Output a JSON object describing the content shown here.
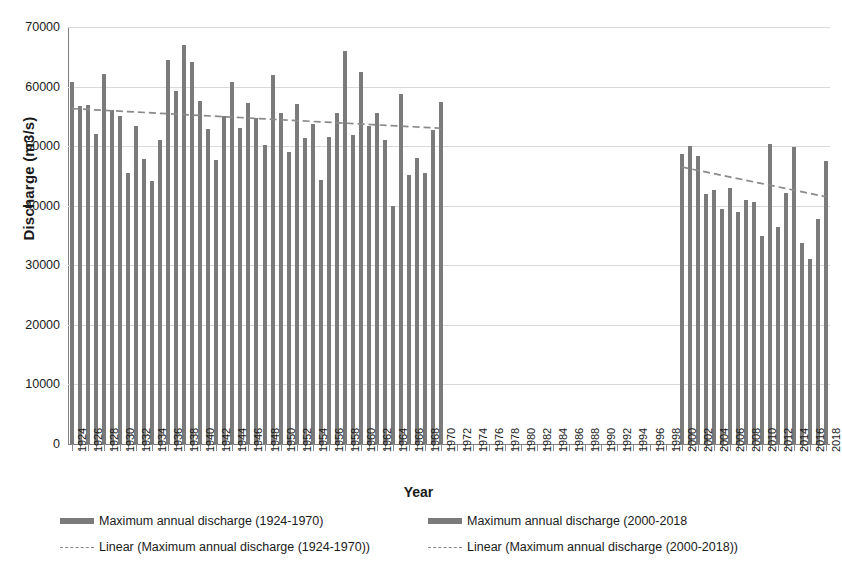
{
  "chart_data": {
    "type": "bar",
    "title": "",
    "xlabel": "Year",
    "ylabel": "Discharge (m3/s)",
    "ylim": [
      0,
      70000
    ],
    "ytick_values": [
      0,
      10000,
      20000,
      30000,
      40000,
      50000,
      60000,
      70000
    ],
    "ytick_labels": [
      "0",
      "10000",
      "20000",
      "30000",
      "40000",
      "50000",
      "60000",
      "70000"
    ],
    "grid": true,
    "legend_position": "bottom",
    "xtick_label_step": 2,
    "x_all": [
      1924,
      1925,
      1926,
      1927,
      1928,
      1929,
      1930,
      1931,
      1932,
      1933,
      1934,
      1935,
      1936,
      1937,
      1938,
      1939,
      1940,
      1941,
      1942,
      1943,
      1944,
      1945,
      1946,
      1947,
      1948,
      1949,
      1950,
      1951,
      1952,
      1953,
      1954,
      1955,
      1956,
      1957,
      1958,
      1959,
      1960,
      1961,
      1962,
      1963,
      1964,
      1965,
      1966,
      1967,
      1968,
      1969,
      1970,
      1971,
      1972,
      1973,
      1974,
      1975,
      1976,
      1977,
      1978,
      1979,
      1980,
      1981,
      1982,
      1983,
      1984,
      1985,
      1986,
      1987,
      1988,
      1989,
      1990,
      1991,
      1992,
      1993,
      1994,
      1995,
      1996,
      1997,
      1998,
      1999,
      2000,
      2001,
      2002,
      2003,
      2004,
      2005,
      2006,
      2007,
      2008,
      2009,
      2010,
      2011,
      2012,
      2013,
      2014,
      2015,
      2016,
      2017,
      2018
    ],
    "xtick_labels_shown": [
      "1924",
      "1926",
      "1928",
      "1930",
      "1932",
      "1934",
      "1936",
      "1938",
      "1940",
      "1942",
      "1944",
      "1946",
      "1948",
      "1950",
      "1952",
      "1954",
      "1956",
      "1958",
      "1960",
      "1962",
      "1964",
      "1966",
      "1968",
      "1970",
      "1972",
      "1974",
      "1976",
      "1978",
      "1980",
      "1982",
      "1984",
      "1986",
      "1988",
      "1990",
      "1992",
      "1994",
      "1996",
      "1998",
      "2000",
      "2002",
      "2004",
      "2006",
      "2008",
      "2010",
      "2012",
      "2014",
      "2016",
      "2018"
    ],
    "series": [
      {
        "name": "Maximum annual discharge (1924-1970)",
        "color": "#7b7b7b",
        "x": [
          1924,
          1925,
          1926,
          1927,
          1928,
          1929,
          1930,
          1931,
          1932,
          1933,
          1934,
          1935,
          1936,
          1937,
          1938,
          1939,
          1940,
          1941,
          1942,
          1943,
          1944,
          1945,
          1946,
          1947,
          1948,
          1949,
          1950,
          1951,
          1952,
          1953,
          1954,
          1955,
          1956,
          1957,
          1958,
          1959,
          1960,
          1961,
          1962,
          1963,
          1964,
          1965,
          1966,
          1967,
          1968,
          1969,
          1970
        ],
        "values": [
          60800,
          56800,
          56900,
          52100,
          62100,
          56000,
          55000,
          45500,
          53300,
          47900,
          44200,
          51000,
          64400,
          59300,
          67000,
          64200,
          57600,
          52900,
          47700,
          55000,
          60800,
          53100,
          57300,
          54800,
          50200,
          62000,
          55600,
          49000,
          57000,
          51400,
          53700,
          44300,
          51600,
          55500,
          66000,
          51900,
          62500,
          53300,
          55500,
          51000,
          40000,
          58700,
          45200,
          48000,
          45500,
          52700,
          57400
        ]
      },
      {
        "name": "Maximum annual discharge (2000-2018",
        "color": "#7b7b7b",
        "x": [
          2000,
          2001,
          2002,
          2003,
          2004,
          2005,
          2006,
          2007,
          2008,
          2009,
          2010,
          2011,
          2012,
          2013,
          2014,
          2015,
          2016,
          2017,
          2018
        ],
        "values": [
          48700,
          50100,
          48400,
          42000,
          42600,
          39500,
          43000,
          39000,
          41000,
          40700,
          35000,
          50300,
          36400,
          42100,
          49900,
          33700,
          31000,
          37700,
          47500
        ]
      }
    ],
    "trendlines": [
      {
        "name": "Linear (Maximum annual discharge (1924-1970))",
        "style": "dashed",
        "color": "#8a8a8a",
        "x_start": 1924,
        "x_end": 1970,
        "y_start": 56300,
        "y_end": 53000
      },
      {
        "name": "Linear (Maximum annual discharge (2000-2018))",
        "style": "dashed",
        "color": "#8a8a8a",
        "x_start": 2000,
        "x_end": 2018,
        "y_start": 46500,
        "y_end": 41500
      }
    ]
  },
  "legend": {
    "items": [
      {
        "label": "Maximum annual discharge (1924-1970)",
        "marker": "bar"
      },
      {
        "label": "Maximum annual discharge (2000-2018",
        "marker": "bar"
      },
      {
        "label": "Linear (Maximum annual discharge (1924-1970))",
        "marker": "dashed-line"
      },
      {
        "label": "Linear (Maximum annual discharge (2000-2018))",
        "marker": "dashed-line"
      }
    ]
  },
  "axes": {
    "y_title": "Discharge (m3/s)",
    "x_title": "Year"
  }
}
